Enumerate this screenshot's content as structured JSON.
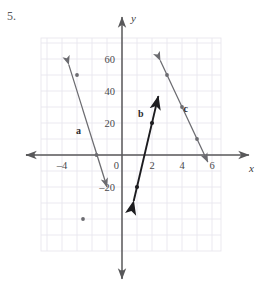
{
  "problem": {
    "number": "5."
  },
  "chart_data": {
    "type": "line",
    "title": "",
    "xlabel": "x",
    "ylabel": "y",
    "xlim": [
      -5.5,
      7.0
    ],
    "ylim": [
      -62,
      78
    ],
    "grid": true,
    "grid_step_x": 1,
    "grid_step_y": 10,
    "x_ticks": [
      -4,
      0,
      2,
      4,
      6
    ],
    "x_tick_labels": [
      "-4",
      "0",
      "2",
      "4",
      "6"
    ],
    "y_ticks": [
      60,
      40,
      20,
      -20
    ],
    "y_tick_labels": [
      "60",
      "40",
      "20",
      "-20"
    ],
    "series": [
      {
        "name": "a",
        "label": "a",
        "label_at": [
          -2.9,
          13
        ],
        "color": "#6b6b70",
        "slope": -30,
        "intercept": -50,
        "x_from": -3.55,
        "x_to": -1.0,
        "arrow_both_ends": true,
        "points": [
          [
            -3.0,
            50
          ],
          [
            -1.7,
            0
          ],
          [
            -2.6,
            -40
          ]
        ],
        "marked_points": [
          [
            -3.0,
            50
          ],
          [
            -1.7,
            0
          ],
          [
            -2.6,
            -40
          ]
        ]
      },
      {
        "name": "b",
        "label": "b",
        "label_at": [
          1.25,
          24
        ],
        "color": "#1c1c1f",
        "slope": 40,
        "intercept": -60,
        "x_from": 0.78,
        "x_to": 2.42,
        "arrow_both_ends": true,
        "points": [
          [
            1.0,
            -20
          ],
          [
            1.5,
            0
          ],
          [
            2.0,
            20
          ]
        ],
        "marked_points": [
          [
            1.0,
            -20
          ],
          [
            2.0,
            20
          ]
        ]
      },
      {
        "name": "c",
        "label": "c",
        "label_at": [
          4.25,
          27
        ],
        "color": "#6b6b70",
        "slope": -20,
        "intercept": 110,
        "x_from": 2.55,
        "x_to": 5.72,
        "arrow_both_ends": true,
        "points": [
          [
            3.0,
            50
          ],
          [
            4.0,
            30
          ],
          [
            5.0,
            10
          ]
        ],
        "marked_points": [
          [
            3.0,
            50
          ],
          [
            4.0,
            30
          ],
          [
            5.0,
            10
          ]
        ]
      }
    ]
  },
  "colors": {
    "grid": "#e9e6ee",
    "axis": "#58585a",
    "line_gray": "#6b6b70",
    "line_dark": "#1c1c1f",
    "text": "#4a4a4c"
  }
}
